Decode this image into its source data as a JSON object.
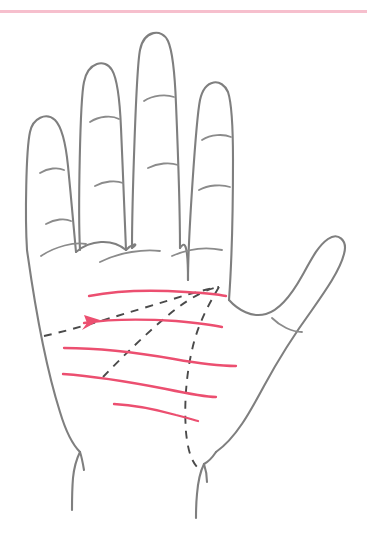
{
  "page": {
    "background_color": "#ffffff",
    "width": 367,
    "height": 547
  },
  "divider": {
    "name": "top-divider-rule",
    "color": "#f6bfcd",
    "thickness_px": 3,
    "y_px": 10,
    "label": ""
  },
  "figure": {
    "label": "Left palm with major and minor lines",
    "orientation": "palm facing viewer, thumb on right side",
    "outline_color": "#7f7f7f",
    "crease_color": "#8b8b8b",
    "major_line_color": "#4a4a4a",
    "major_line_style": "dashed",
    "minor_line_color": "#ec4f70",
    "minor_line_style": "solid"
  },
  "digits": [
    {
      "name": "pinky-finger",
      "label": "Pinky",
      "creases": 2
    },
    {
      "name": "ring-finger",
      "label": "Ring",
      "creases": 2
    },
    {
      "name": "middle-finger",
      "label": "Middle",
      "creases": 2
    },
    {
      "name": "index-finger",
      "label": "Index",
      "creases": 2
    },
    {
      "name": "thumb",
      "label": "Thumb",
      "creases": 1
    }
  ],
  "major_lines": [
    {
      "name": "heart-line",
      "label": "Heart line",
      "style": "dashed",
      "color": "#4a4a4a"
    },
    {
      "name": "head-line",
      "label": "Head line",
      "style": "dashed",
      "color": "#4a4a4a"
    },
    {
      "name": "life-line",
      "label": "Life line",
      "style": "dashed",
      "color": "#4a4a4a"
    }
  ],
  "minor_lines": [
    {
      "name": "minor-line-1",
      "label": "Minor line 1",
      "color": "#ec4f70"
    },
    {
      "name": "minor-line-2",
      "label": "Minor line 2",
      "color": "#ec4f70",
      "has_arrow_marker": true
    },
    {
      "name": "minor-line-3",
      "label": "Minor line 3",
      "color": "#ec4f70"
    },
    {
      "name": "minor-line-4",
      "label": "Minor line 4",
      "color": "#ec4f70"
    },
    {
      "name": "minor-line-5",
      "label": "Minor line 5",
      "color": "#ec4f70"
    }
  ],
  "wrist": {
    "name": "wrist-lines",
    "label": "Wrist creases",
    "count": 2
  },
  "annotation_marker": {
    "name": "arrow-marker",
    "label": "",
    "color": "#ec4f70",
    "on_line": "minor-line-2"
  }
}
